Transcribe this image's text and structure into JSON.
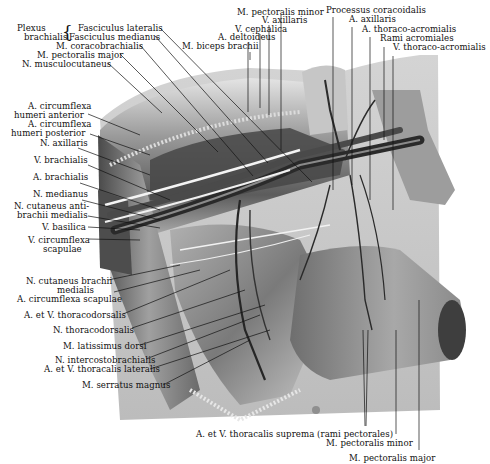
{
  "figure": {
    "colors": {
      "background": "#ffffff",
      "label_text": "#111111",
      "leader_line": "#111111",
      "skin_light": "#d9d9d9",
      "muscle_mid": "#8c8c8c",
      "muscle_dark": "#3a3a3a",
      "vessel_dark": "#2a2a2a",
      "nerve_light": "#f2f2f2"
    }
  },
  "labels": {
    "top_left": {
      "plexus_group_line1": "Plexus",
      "plexus_group_line2": "brachialis",
      "fasciculus_lateralis": "Fasciculus lateralis",
      "fasciculus_medianus": "Fasciculus medianus",
      "m_coracobrachialis": "M. coracobrachialis",
      "m_pectoralis_major": "M. pectoralis major",
      "n_musculocutaneus": "N. musculocutaneus"
    },
    "top_center": {
      "m_pectoralis_minor": "M. pectoralis minor",
      "v_axillaris": "V. axillaris",
      "v_cephalica": "V. cephalica",
      "a_deltoideus": "A. deltoideus",
      "m_biceps_brachii": "M. biceps brachii"
    },
    "top_right": {
      "processus_coracoidalis": "Processus coracoidalis",
      "a_axillaris": "A. axillaris",
      "a_thoraco_acromialis": "A. thoraco-acromialis",
      "rami_acromiales": "Rami acromiales",
      "v_thoraco_acromialis": "V. thoraco-acromialis"
    },
    "left": {
      "a_circumflexa_humeri_anterior_1": "A. circumflexa",
      "a_circumflexa_humeri_anterior_2": "humeri anterior",
      "a_circumflexa_humeri_posterior_1": "A. circumflexa",
      "a_circumflexa_humeri_posterior_2": "humeri posterior",
      "n_axillaris": "N. axillaris",
      "v_brachialis": "V. brachialis",
      "a_brachialis": "A. brachialis",
      "n_medianus": "N. medianus",
      "n_cutaneus_antibrachii_medialis_1": "N. cutaneus anti-",
      "n_cutaneus_antibrachii_medialis_2": "brachii medialis",
      "v_basilica": "V. basilica",
      "v_circumflexa_scapulae_1": "V. circumflexa",
      "v_circumflexa_scapulae_2": "scapulae",
      "n_cutaneus_brachii_medialis_1": "N. cutaneus brachii",
      "n_cutaneus_brachii_medialis_2": "medialis",
      "a_circumflexa_scapulae": "A. circumflexa scapulae",
      "a_et_v_thoracodorsalis": "A. et V. thoracodorsalis",
      "n_thoracodorsalis": "N. thoracodorsalis",
      "m_latissimus_dorsi": "M. latissimus dorsi",
      "n_intercostobrachialis": "N. intercostobrachialis",
      "a_et_v_thoracalis_lateralis": "A. et V. thoracalis lateralis",
      "m_serratus_magnus": "M. serratus magnus"
    },
    "bottom": {
      "a_et_v_thoracalis_suprema": "A. et V. thoracalis suprema (rami pectorales)",
      "m_pectoralis_minor": "M. pectoralis minor",
      "m_pectoralis_major": "M. pectoralis major"
    }
  }
}
